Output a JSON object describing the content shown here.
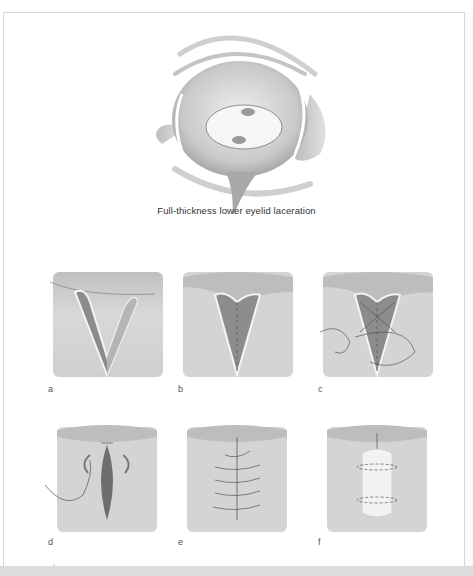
{
  "figure": {
    "main_caption": "Full-thickness lower eyelid laceration",
    "panels": [
      {
        "label": "a",
        "description": "V-shaped full-thickness laceration"
      },
      {
        "label": "b",
        "description": "Tarsal plate alignment suture"
      },
      {
        "label": "c",
        "description": "Interrupted tarsal sutures placed"
      },
      {
        "label": "d",
        "description": "Skin closure with suture"
      },
      {
        "label": "e",
        "description": "Interrupted skin sutures complete"
      },
      {
        "label": "f",
        "description": "Bolster dressing tied over repair"
      }
    ],
    "colors": {
      "skin": "#d2d2d2",
      "wound": "#8c8c8c",
      "outline": "#f4f4f4",
      "suture": "#555555",
      "frame_border": "#d8d8d8",
      "bottom_band": "#dcdcdc"
    }
  }
}
